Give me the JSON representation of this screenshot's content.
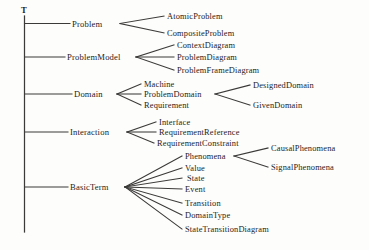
{
  "diagram": {
    "type": "tree",
    "orientation": "left-to-right",
    "line_color": "#3b3a38",
    "text_color": "#1d1c1b",
    "background_color": "#fdfdfc",
    "root": {
      "label": "T"
    },
    "nodes": {
      "root": "T",
      "problem": "Problem",
      "atomic_problem": "AtomicProblem",
      "composite_problem": "CompositeProblem",
      "problem_model": "ProblemModel",
      "context_diagram": "ContextDiagram",
      "problem_diagram": "ProblemDiagram",
      "problem_frame_diagram": "ProblemFrameDiagram",
      "domain": "Domain",
      "machine": "Machine",
      "problem_domain": "ProblemDomain",
      "designed_domain": "DesignedDomain",
      "given_domain": "GivenDomain",
      "requirement": "Requirement",
      "interaction": "Interaction",
      "interface": "Interface",
      "requirement_reference": "RequirementReference",
      "requirement_constraint": "RequirementConstraint",
      "basic_term": "BasicTerm",
      "phenomena": "Phenomena",
      "causal_phenomena": "CausalPhenomena",
      "signal_phenomena": "SignalPhenomena",
      "value": "Value",
      "state": "State",
      "event": "Event",
      "transition": "Transition",
      "domain_type": "DomainType",
      "state_transition_diagram": "StateTransitionDiagram"
    },
    "hierarchy": [
      {
        "label": "Problem",
        "children": [
          "AtomicProblem",
          "CompositeProblem"
        ]
      },
      {
        "label": "ProblemModel",
        "children": [
          "ContextDiagram",
          "ProblemDiagram",
          "ProblemFrameDiagram"
        ]
      },
      {
        "label": "Domain",
        "children": [
          "Machine",
          {
            "label": "ProblemDomain",
            "children": [
              "DesignedDomain",
              "GivenDomain"
            ]
          },
          "Requirement"
        ]
      },
      {
        "label": "Interaction",
        "children": [
          "Interface",
          "RequirementReference",
          "RequirementConstraint"
        ]
      },
      {
        "label": "BasicTerm",
        "children": [
          {
            "label": "Phenomena",
            "children": [
              "CausalPhenomena",
              "SignalPhenomena"
            ]
          },
          "Value",
          "State",
          "Event",
          "Transition",
          "DomainType",
          "StateTransitionDiagram"
        ]
      }
    ]
  }
}
